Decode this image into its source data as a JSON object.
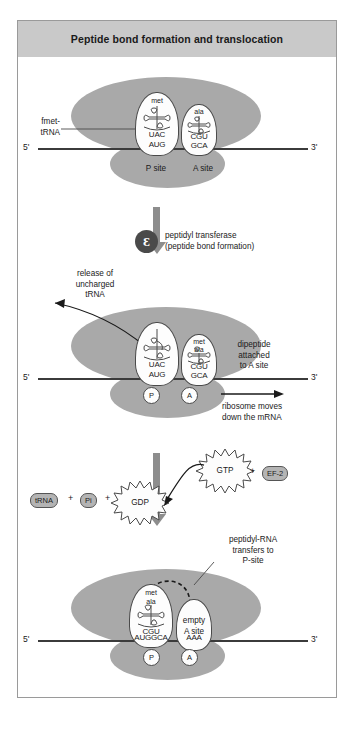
{
  "figure": {
    "title": "Peptide bond formation and translocation"
  },
  "stage1": {
    "label_fmet": "fmet-\ntRNA",
    "five_prime": "5ʹ",
    "three_prime": "3ʹ",
    "p_trna": {
      "amino_acid": "met",
      "anticodon": "UAC",
      "codon": "AUG"
    },
    "a_trna": {
      "amino_acid": "ala",
      "anticodon": "CGU",
      "codon": "GCA"
    },
    "p_site_label": "P site",
    "a_site_label": "A site"
  },
  "step1": {
    "enzyme_icon": "enzyme-symbol",
    "enzyme_glyph": "Ɛ",
    "line1": "peptidyl transferase",
    "line2": "(peptide bond formation)"
  },
  "stage2": {
    "release_label": "release of\nuncharged\ntRNA",
    "dipeptide_label": "dipeptide\nattached\nto A site",
    "five_prime": "5ʹ",
    "three_prime": "3ʹ",
    "p_trna": {
      "anticodon": "UAC",
      "codon": "AUG"
    },
    "a_trna": {
      "amino_acid_1": "met",
      "amino_acid_2": "ala",
      "anticodon": "CGU",
      "codon": "GCA"
    },
    "p_site_label": "P",
    "a_site_label": "A",
    "move_label": "ribosome moves\ndown the mRNA"
  },
  "energy": {
    "trna": "tRNA",
    "plus1": "+",
    "pi": "Pi",
    "plus2": "+",
    "gdp": "GDP",
    "gtp": "GTP",
    "plus3": "+",
    "ef2": "EF-2"
  },
  "stage3": {
    "transfer_label": "peptidyl-RNA\ntransfers to\nP-site",
    "five_prime": "5ʹ",
    "three_prime": "3ʹ",
    "p_trna": {
      "amino_acid_1": "met",
      "amino_acid_2": "ala",
      "anticodon": "CGU"
    },
    "empty_label": "empty\nA site",
    "mrna_codons_p": "AUGGCA",
    "mrna_codons_a": "AAA",
    "p_site_label": "P",
    "a_site_label": "A"
  },
  "colors": {
    "ribosome": "#a9a9a9",
    "title_bar": "#c9c9c9",
    "arrow": "#8d8d8d",
    "outline": "#4a4a4a",
    "mrna": "#3b3b3b"
  }
}
